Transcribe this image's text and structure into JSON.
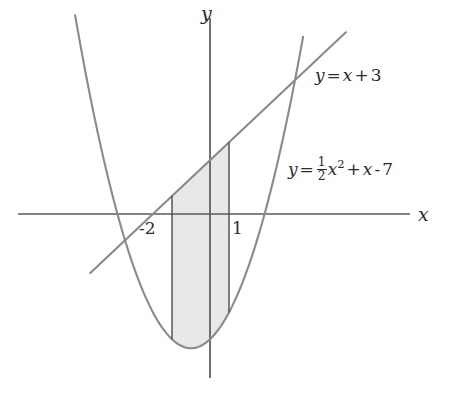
{
  "figure": {
    "type": "math-graph",
    "background_color": "#ffffff",
    "stroke_color": "#5a5a5a",
    "axis_color": "#5a5a5a",
    "text_color": "#2b2b2b",
    "shade_color": "#e8e8e8"
  },
  "axes": {
    "x_label": "x",
    "y_label": "y",
    "origin_px": {
      "x": 210,
      "y": 214
    },
    "x_scale_px_per_unit": 19,
    "y_scale_px_per_unit": 17.9,
    "x_axis_range_px": [
      18,
      410
    ],
    "y_axis_range_px": [
      18,
      378
    ]
  },
  "ticks": [
    {
      "name": "tick-minus-2",
      "label": "-2",
      "x_value": -2,
      "px_x": 152,
      "px_y": 234
    },
    {
      "name": "tick-1",
      "label": "1",
      "x_value": 1,
      "px_x": 233,
      "px_y": 234
    }
  ],
  "curves": [
    {
      "name": "line",
      "label": "y = x + 3",
      "label_parts": {
        "lhs": "y",
        "eq": "=",
        "rhs_var": "x",
        "plus": "+",
        "constant": "3"
      },
      "expression": "x + 3",
      "slope": 1,
      "intercept": 3,
      "label_px": {
        "x": 315,
        "y": 76
      }
    },
    {
      "name": "parabola",
      "label": "y = 1/2 x^2 + x - 7",
      "label_parts": {
        "lhs": "y",
        "eq": "=",
        "frac_num": "1",
        "frac_den": "2",
        "var": "x",
        "exponent": "2",
        "plus": "+",
        "linear_var": "x",
        "minus": "-",
        "constant": "7"
      },
      "expression": "0.5*x^2 + x - 7",
      "vertex": {
        "x": -1,
        "y": -7.5
      },
      "roots": [
        -5.477,
        3.477
      ],
      "label_px": {
        "x": 288,
        "y": 166
      }
    }
  ],
  "shaded_region": {
    "name": "area-between-curves",
    "upper_curve": "line",
    "lower_curve": "parabola",
    "x_from": -2,
    "x_to": 1,
    "boundary_lines": [
      {
        "name": "left-boundary",
        "x_value": -2,
        "px_x": 172
      },
      {
        "name": "right-boundary",
        "x_value": 1,
        "px_x": 229
      }
    ]
  },
  "chart_data": {
    "type": "line",
    "title": "",
    "xlabel": "x",
    "ylabel": "y",
    "xlim": [
      -10.1,
      10.5
    ],
    "ylim": [
      -9.2,
      11.0
    ],
    "grid": false,
    "legend": "inline-labels",
    "series": [
      {
        "name": "y = x + 3",
        "kind": "line",
        "expression": "x + 3",
        "x": [
          -6.3,
          7.1
        ],
        "y": [
          -3.3,
          10.1
        ]
      },
      {
        "name": "y = 1/2 x^2 + x - 7",
        "kind": "parabola",
        "expression": "0.5*x^2 + x - 7",
        "x": [
          -7.1,
          5.0
        ],
        "y": [
          10.7,
          10.5
        ]
      }
    ],
    "annotations": [
      {
        "text": "y = x + 3",
        "x": 5.5,
        "y": 7.7
      },
      {
        "text": "y = 1/2 x^2 + x - 7",
        "x": 4.1,
        "y": 2.7
      },
      {
        "text": "-2",
        "x": -2.6,
        "y": -1.2
      },
      {
        "text": "1",
        "x": 1.2,
        "y": -1.2
      }
    ],
    "shaded": {
      "x_from": -2,
      "x_to": 1,
      "between": [
        "y = x + 3",
        "y = 1/2 x^2 + x - 7"
      ]
    }
  }
}
